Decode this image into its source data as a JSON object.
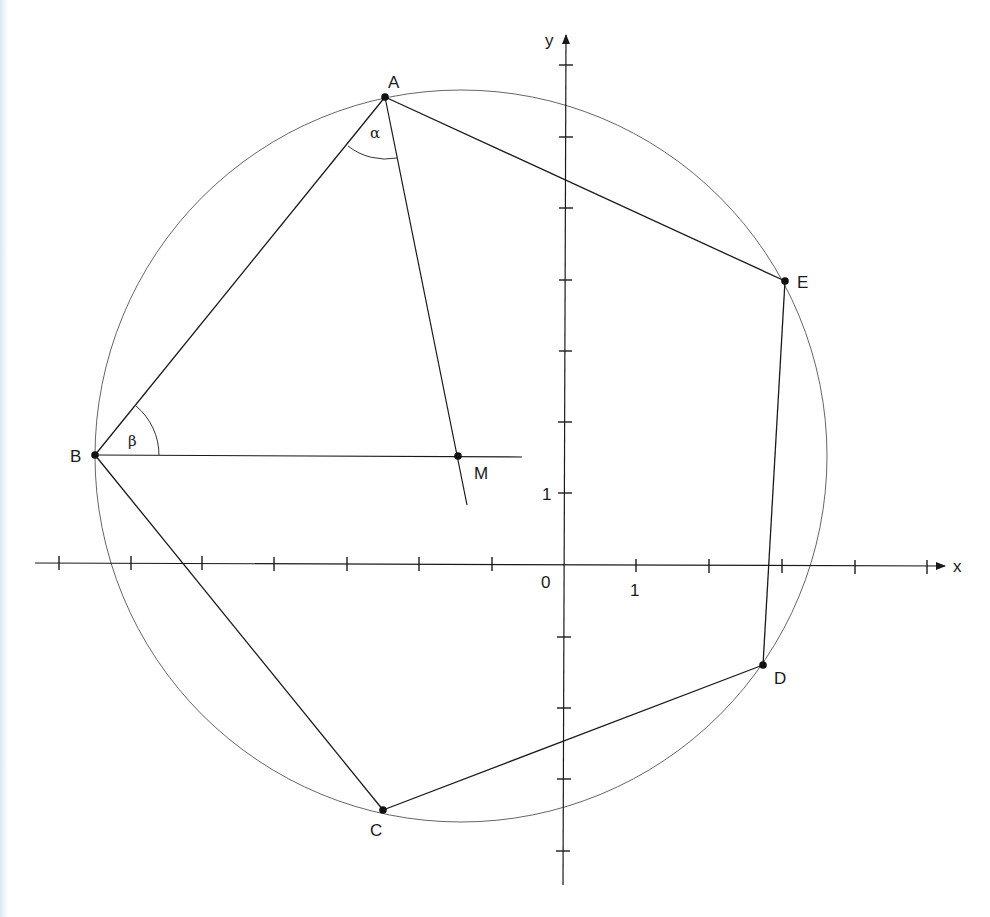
{
  "diagram": {
    "type": "geometry-construction",
    "axes": {
      "x_label": "x",
      "y_label": "y",
      "origin_label": "0",
      "x_unit_label": "1",
      "y_unit_label": "1",
      "origin_px": [
        564,
        562
      ],
      "unit_px": 71.5
    },
    "points": [
      {
        "name": "A",
        "label": "A",
        "px": [
          385,
          97
        ]
      },
      {
        "name": "B",
        "label": "B",
        "px": [
          95,
          455
        ]
      },
      {
        "name": "C",
        "label": "C",
        "px": [
          383,
          810
        ]
      },
      {
        "name": "D",
        "label": "D",
        "px": [
          763,
          665
        ]
      },
      {
        "name": "E",
        "label": "E",
        "px": [
          785,
          281
        ]
      },
      {
        "name": "M",
        "label": "M",
        "px": [
          458,
          456
        ]
      }
    ],
    "angles": [
      {
        "name": "alpha",
        "label": "α",
        "vertex": "A",
        "between": [
          "B",
          "M"
        ]
      },
      {
        "name": "beta",
        "label": "β",
        "vertex": "B",
        "between": [
          "A",
          "M"
        ]
      }
    ],
    "circle": {
      "center": "M",
      "center_px": [
        461,
        456
      ],
      "radius_px": 366
    },
    "polygon": [
      "A",
      "E",
      "D",
      "C",
      "B"
    ],
    "colors": {
      "line": "#1a1a1a",
      "circle": "#555555",
      "background": "#ffffff"
    }
  }
}
